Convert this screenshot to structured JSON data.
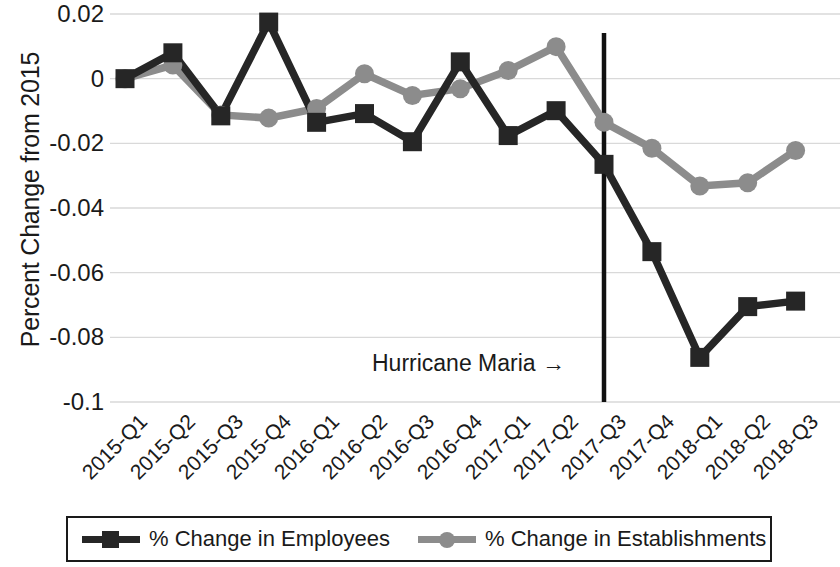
{
  "chart_data": {
    "type": "line",
    "title": "",
    "xlabel": "",
    "ylabel": "Percent Change from 2015",
    "categories": [
      "2015-Q1",
      "2015-Q2",
      "2015-Q3",
      "2015-Q4",
      "2016-Q1",
      "2016-Q2",
      "2016-Q3",
      "2016-Q4",
      "2017-Q1",
      "2017-Q2",
      "2017-Q3",
      "2017-Q4",
      "2018-Q1",
      "2018-Q2",
      "2018-Q3"
    ],
    "ylim": [
      -0.1,
      0.02
    ],
    "yticks": [
      0.02,
      0,
      -0.02,
      -0.04,
      -0.06,
      -0.08,
      -0.1
    ],
    "ytick_labels": [
      "0.02",
      "0",
      "-0.02",
      "-0.04",
      "-0.06",
      "-0.08",
      "-0.1"
    ],
    "grid": true,
    "legend_position": "bottom",
    "series": [
      {
        "name": "% Change in Employees",
        "color": "#262626",
        "marker": "square",
        "values": [
          0.0,
          0.008,
          -0.0115,
          0.0175,
          -0.0135,
          -0.0108,
          -0.0195,
          0.0052,
          -0.0176,
          -0.0099,
          -0.0265,
          -0.0535,
          -0.0862,
          -0.0705,
          -0.0688
        ]
      },
      {
        "name": "% Change in Establishments",
        "color": "#8c8c8c",
        "marker": "circle",
        "values": [
          0.0,
          0.0042,
          -0.0112,
          -0.0122,
          -0.0092,
          0.0015,
          -0.0052,
          -0.0031,
          0.0025,
          0.0099,
          -0.0135,
          -0.0215,
          -0.0332,
          -0.0322,
          -0.0222
        ]
      }
    ],
    "annotations": [
      {
        "text": "Hurricane Maria  →",
        "type": "event-marker",
        "x_category": "2017-Q3"
      }
    ]
  },
  "legend": {
    "items": [
      {
        "label": "% Change in Employees",
        "color": "#262626",
        "marker": "square"
      },
      {
        "label": "% Change in Establishments",
        "color": "#8c8c8c",
        "marker": "circle"
      }
    ]
  }
}
